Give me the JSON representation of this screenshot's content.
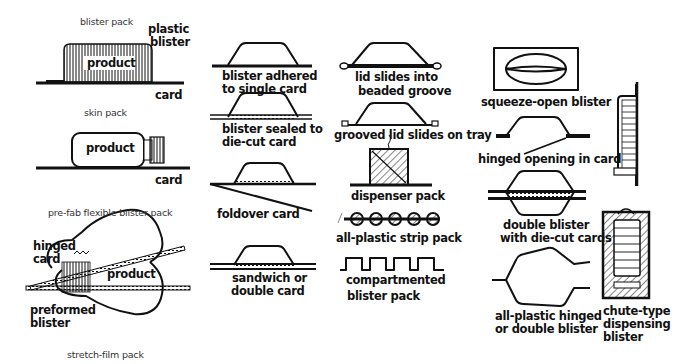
{
  "column1": {
    "blister_pack": {
      "title": "blister pack",
      "callouts": [
        "plastic",
        "blister"
      ],
      "product": "product",
      "card": "card"
    },
    "skin_pack": {
      "title": "skin pack",
      "product": "product",
      "card": "card"
    },
    "prefab": {
      "title": "pre-fab flexible blister pack",
      "hinged": [
        "hinged",
        "card"
      ],
      "product": "product",
      "preformed": [
        "preformed",
        "blister"
      ]
    },
    "stretch_film": {
      "title": "stretch-film pack"
    }
  },
  "column2": {
    "items": [
      {
        "label": [
          "blister adhered",
          "to single card"
        ]
      },
      {
        "label": [
          "blister sealed to",
          "die-cut card"
        ]
      },
      {
        "label": [
          "foldover card"
        ]
      },
      {
        "label": [
          "sandwich or",
          "double card"
        ]
      }
    ]
  },
  "column3": {
    "items": [
      {
        "label": [
          "lid slides into",
          "beaded groove"
        ]
      },
      {
        "label": [
          "grooved lid slides on tray"
        ]
      },
      {
        "label": [
          "dispenser pack"
        ]
      },
      {
        "label": [
          "all-plastic strip pack"
        ]
      },
      {
        "label": [
          "compartmented",
          "blister pack"
        ]
      }
    ]
  },
  "column4": {
    "items": [
      {
        "label": [
          "squeeze-open blister"
        ]
      },
      {
        "label": [
          "hinged opening in card"
        ]
      },
      {
        "label": [
          "double blister",
          "with die-cut cards"
        ]
      },
      {
        "label": [
          "all-plastic hinged",
          "or double blister"
        ]
      }
    ]
  },
  "column5": {
    "items": [
      {
        "label": [
          "chute-type",
          "dispensing",
          "blister"
        ]
      }
    ]
  }
}
